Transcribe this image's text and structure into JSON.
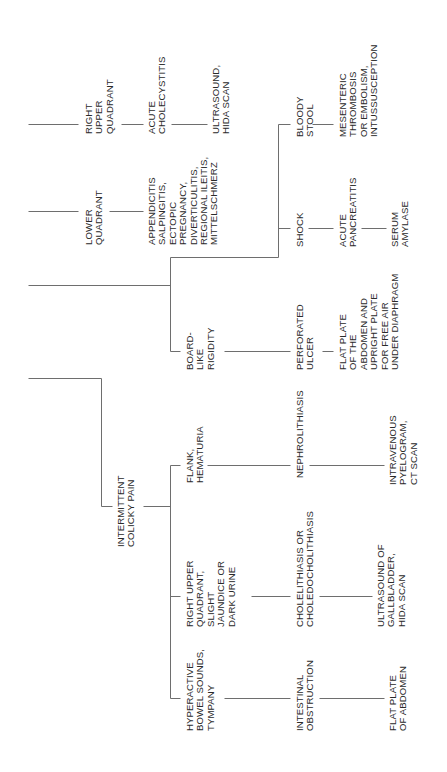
{
  "diagram": {
    "title": "",
    "orientation": "rotated-90-ccw",
    "colors": {
      "background": "#ffffff",
      "line": "#6e6e6e",
      "text": "#2a2a2a"
    },
    "nodes": [
      {
        "id": "ruq-top",
        "label": "RIGHT\nUPPER\nQUADRANT",
        "x": 84,
        "bottom": 134
      },
      {
        "id": "acute-cholecystitis",
        "label": "ACUTE\nCHOLECYSTITIS",
        "x": 147,
        "bottom": 134
      },
      {
        "id": "ultrasound-hida",
        "label": "ULTRASOUND,\nHIDA SCAN",
        "x": 211,
        "bottom": 134
      },
      {
        "id": "lower-quadrant",
        "label": "LOWER\nQUADRANT",
        "x": 84,
        "bottom": 245
      },
      {
        "id": "appendicitis-group",
        "label": "APPENDICITIS\nSALPINGITIS,\nECTOPIC\nPREGNANCY,\nDIVERTICULITIS,\nREGIONAL ILEITIS,\nMITTELSCHMERZ",
        "x": 147,
        "bottom": 245
      },
      {
        "id": "bloody-stool",
        "label": "BLOODY\nSTOOL",
        "x": 295,
        "bottom": 137
      },
      {
        "id": "mesenteric",
        "label": "MESENTERIC\nTHROMBOSIS\nOR EMBOLISM,\nINTUSSUSCEPTION",
        "x": 338,
        "bottom": 137
      },
      {
        "id": "shock",
        "label": "SHOCK",
        "x": 295,
        "bottom": 247
      },
      {
        "id": "acute-pancreatitis",
        "label": "ACUTE\nPANCREATITIS",
        "x": 338,
        "bottom": 247
      },
      {
        "id": "serum-amylase",
        "label": "SERUM\nAMYLASE",
        "x": 390,
        "bottom": 247
      },
      {
        "id": "board-like-rigidity",
        "label": "BOARD-\nLIKE\nRIGIDITY",
        "x": 185,
        "bottom": 370
      },
      {
        "id": "perforated-ulcer",
        "label": "PERFORATED\nULCER",
        "x": 295,
        "bottom": 370
      },
      {
        "id": "flat-plate-upright",
        "label": "FLAT PLATE\nOF THE\nABDOMEN AND\nUPRIGHT PLATE\nFOR FREE AIR\nUNDER DIAPHRAGM",
        "x": 338,
        "bottom": 370
      },
      {
        "id": "flank-hematuria",
        "label": "FLANK,\nHEMATURIA",
        "x": 185,
        "bottom": 483
      },
      {
        "id": "nephrolithiasis",
        "label": "NEPHROLITHIASIS",
        "x": 295,
        "bottom": 478
      },
      {
        "id": "ivp-ct",
        "label": "INTRAVENOUS\nPYELOGRAM,\nCT SCAN",
        "x": 388,
        "bottom": 485
      },
      {
        "id": "intermittent-colicky-pain",
        "label": "INTERMITTENT\nCOLICKY PAIN",
        "x": 116,
        "bottom": 547
      },
      {
        "id": "ruq-jaundice",
        "label": "RIGHT UPPER\nQUADRANT,\nSLIGHT\nJAUNDICE OR\nDARK URINE",
        "x": 185,
        "bottom": 627
      },
      {
        "id": "cholelithiasis",
        "label": "CHOLELITHIASIS OR\nCHOLEDOCHOLITHIASIS",
        "x": 295,
        "bottom": 627
      },
      {
        "id": "ultrasound-gallbladder",
        "label": "ULTRASOUND OF\nGALLBLADDER,\nHIDA SCAN",
        "x": 376,
        "bottom": 627
      },
      {
        "id": "hyperactive-bowel",
        "label": "HYPERACTIVE\nBOWEL SOUNDS,\nTYMPANY",
        "x": 185,
        "bottom": 731
      },
      {
        "id": "intestinal-obstruction",
        "label": "INTESTINAL\nOBSTRUCTION",
        "x": 295,
        "bottom": 731
      },
      {
        "id": "flat-plate-abdomen",
        "label": "FLAT PLATE\nOF ABDOMEN",
        "x": 388,
        "bottom": 731
      }
    ],
    "lines": [
      [
        28,
        124,
        78,
        124
      ],
      [
        121,
        124,
        143,
        124
      ],
      [
        171,
        124,
        207,
        124
      ],
      [
        28,
        211,
        78,
        211
      ],
      [
        109,
        211,
        143,
        211
      ],
      [
        28,
        285,
        170,
        285
      ],
      [
        170,
        257,
        170,
        351
      ],
      [
        170,
        351,
        180,
        351
      ],
      [
        170,
        257,
        278,
        257
      ],
      [
        278,
        124,
        278,
        257
      ],
      [
        278,
        124,
        290,
        124
      ],
      [
        278,
        228,
        290,
        228
      ],
      [
        312,
        124,
        333,
        124
      ],
      [
        308,
        228,
        333,
        228
      ],
      [
        361,
        228,
        386,
        228
      ],
      [
        224,
        351,
        290,
        351
      ],
      [
        322,
        351,
        333,
        351
      ],
      [
        28,
        378,
        101,
        378
      ],
      [
        101,
        378,
        101,
        506
      ],
      [
        101,
        506,
        112,
        506
      ],
      [
        143,
        506,
        170,
        506
      ],
      [
        170,
        465,
        170,
        698
      ],
      [
        170,
        465,
        180,
        465
      ],
      [
        207,
        465,
        290,
        465
      ],
      [
        309,
        465,
        384,
        465
      ],
      [
        170,
        596,
        180,
        596
      ],
      [
        251,
        596,
        290,
        596
      ],
      [
        319,
        596,
        372,
        596
      ],
      [
        170,
        698,
        180,
        698
      ],
      [
        224,
        698,
        290,
        698
      ],
      [
        319,
        698,
        384,
        698
      ]
    ]
  }
}
